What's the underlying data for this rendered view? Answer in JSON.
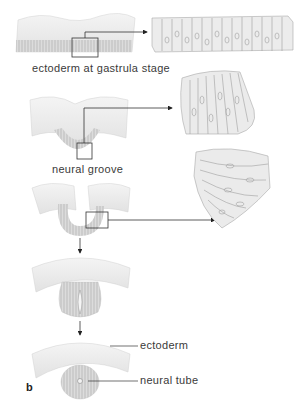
{
  "figure": {
    "panel_letter": "b",
    "stages": [
      {
        "id": "gastrula",
        "label": "ectoderm at gastrula stage"
      },
      {
        "id": "groove",
        "label": "neural groove"
      },
      {
        "id": "folding",
        "label": ""
      },
      {
        "id": "closing",
        "label": ""
      },
      {
        "id": "tube",
        "label": ""
      }
    ],
    "callouts": [
      {
        "id": "ectoderm",
        "label": "ectoderm"
      },
      {
        "id": "neural-tube",
        "label": "neural tube"
      }
    ],
    "colors": {
      "tissue_fill": "#e6e6e6",
      "tissue_light": "#f2f2f2",
      "cell_line": "#9a9a9a",
      "leader_line": "#333333"
    }
  }
}
